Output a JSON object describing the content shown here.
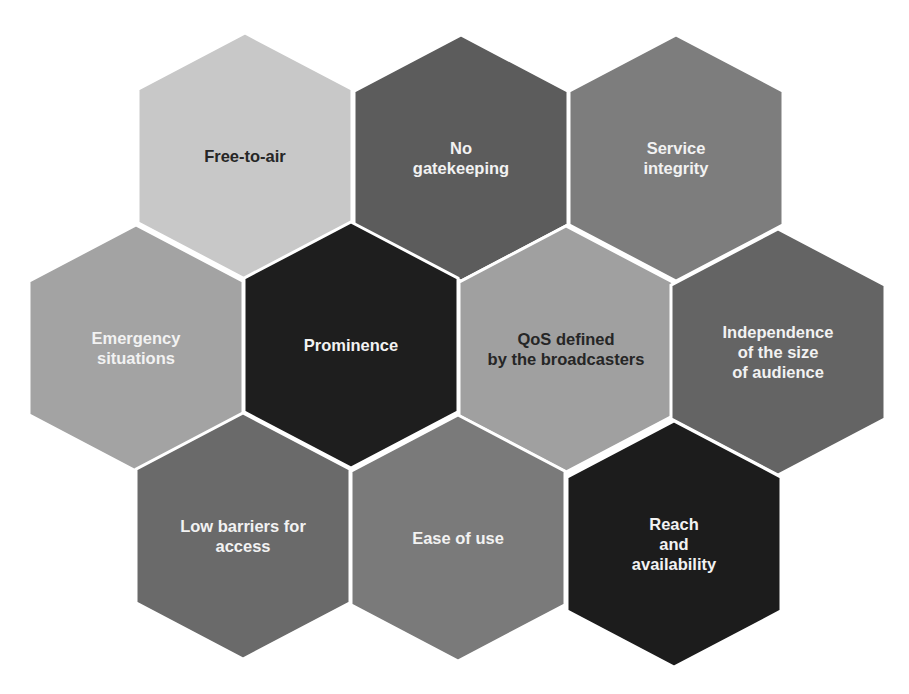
{
  "diagram": {
    "type": "honeycomb",
    "hex_size": {
      "width": 214,
      "height": 246
    },
    "gap_color": "#ffffff",
    "cells": [
      {
        "id": "free-to-air",
        "label_lines": [
          "Free-to-air"
        ],
        "fill": "#c8c8c8",
        "text_color": "#262626",
        "cx": 245,
        "cy": 156
      },
      {
        "id": "no-gatekeeping",
        "label_lines": [
          "No",
          "gatekeeping"
        ],
        "fill": "#5c5c5c",
        "text_color": "#f2f2f2",
        "cx": 461,
        "cy": 158
      },
      {
        "id": "service-integrity",
        "label_lines": [
          "Service",
          "integrity"
        ],
        "fill": "#7d7d7d",
        "text_color": "#f2f2f2",
        "cx": 676,
        "cy": 158
      },
      {
        "id": "emergency-situations",
        "label_lines": [
          "Emergency",
          "situations"
        ],
        "fill": "#a3a3a3",
        "text_color": "#f2f2f2",
        "cx": 136,
        "cy": 348
      },
      {
        "id": "prominence",
        "label_lines": [
          "Prominence"
        ],
        "fill": "#1e1e1e",
        "text_color": "#f2f2f2",
        "cx": 351,
        "cy": 345
      },
      {
        "id": "qos-defined",
        "label_lines": [
          "QoS defined",
          "by the broadcasters"
        ],
        "fill": "#a0a0a0",
        "text_color": "#262626",
        "cx": 566,
        "cy": 349
      },
      {
        "id": "independence",
        "label_lines": [
          "Independence",
          "of the size",
          "of audience"
        ],
        "fill": "#646464",
        "text_color": "#f2f2f2",
        "cx": 778,
        "cy": 352
      },
      {
        "id": "low-barriers",
        "label_lines": [
          "Low barriers for",
          "access"
        ],
        "fill": "#6a6a6a",
        "text_color": "#f2f2f2",
        "cx": 243,
        "cy": 536
      },
      {
        "id": "ease-of-use",
        "label_lines": [
          "Ease of use"
        ],
        "fill": "#7a7a7a",
        "text_color": "#f2f2f2",
        "cx": 458,
        "cy": 538
      },
      {
        "id": "reach-availability",
        "label_lines": [
          "Reach",
          "and",
          "availability"
        ],
        "fill": "#1c1c1c",
        "text_color": "#f2f2f2",
        "cx": 674,
        "cy": 544
      }
    ]
  }
}
